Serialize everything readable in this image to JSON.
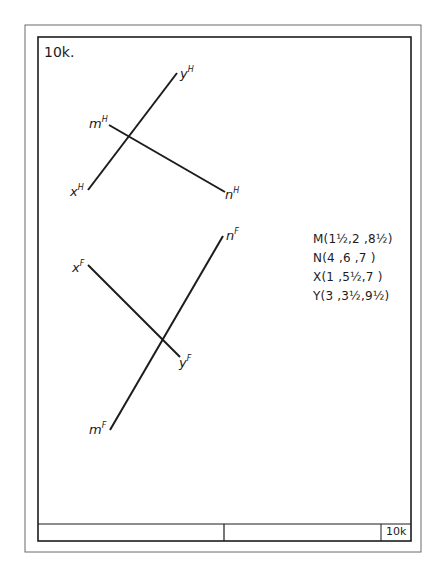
{
  "sheet": {
    "id_label": "10k.",
    "title_block_label": "10k"
  },
  "colors": {
    "ink": "#1c1c1c",
    "outer_border": "#6a6a6a",
    "paper": "#ffffff"
  },
  "views": {
    "horizontal": {
      "lines": [
        {
          "name": "xy",
          "from_label": "x",
          "to_label": "y",
          "superscript": "H"
        },
        {
          "name": "mn",
          "from_label": "m",
          "to_label": "n",
          "superscript": "H"
        }
      ]
    },
    "frontal": {
      "lines": [
        {
          "name": "xy",
          "from_label": "x",
          "to_label": "y",
          "superscript": "F"
        },
        {
          "name": "mn",
          "from_label": "m",
          "to_label": "n",
          "superscript": "F"
        }
      ]
    }
  },
  "coordinates": [
    {
      "point": "M",
      "text": "M(1½,2 ,8½)"
    },
    {
      "point": "N",
      "text": "N(4 ,6 ,7 )"
    },
    {
      "point": "X",
      "text": "X(1 ,5½,7 )"
    },
    {
      "point": "Y",
      "text": "Y(3 ,3½,9½)"
    }
  ],
  "labels": {
    "yH": "y",
    "mH": "m",
    "xH": "x",
    "nH": "n",
    "nF": "n",
    "xF": "x",
    "yF": "y",
    "mF": "m",
    "supH": "H",
    "supF": "F"
  }
}
